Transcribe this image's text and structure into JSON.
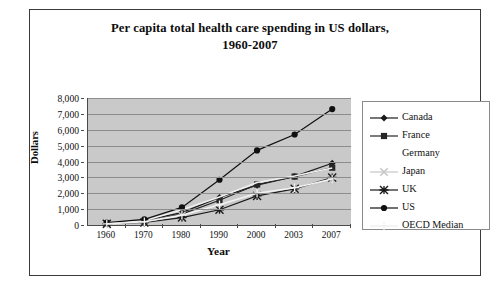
{
  "chart_data": {
    "type": "line",
    "title": "Per capita total health care spending in US dollars,",
    "title_line2": "1960-2007",
    "xlabel": "Year",
    "ylabel": "Dollars",
    "categories": [
      "1960",
      "1970",
      "1980",
      "1990",
      "2000",
      "2003",
      "2007"
    ],
    "ylim": [
      0,
      8000
    ],
    "ytick_labels": [
      "8,000",
      "7,000",
      "6,000",
      "5,000",
      "4,000",
      "3,000",
      "2,000",
      "1,000",
      "0"
    ],
    "ytick_values": [
      8000,
      7000,
      6000,
      5000,
      4000,
      3000,
      2000,
      1000,
      0
    ],
    "grid": true,
    "legend_position": "right",
    "series": [
      {
        "name": "Canada",
        "marker": "diamond",
        "color": "#1a1a1a",
        "values": [
          110,
          290,
          780,
          1740,
          2510,
          3060,
          3890
        ]
      },
      {
        "name": "France",
        "marker": "square",
        "color": "#262626",
        "values": [
          80,
          220,
          690,
          1560,
          2550,
          3050,
          3610
        ]
      },
      {
        "name": "Germany",
        "marker": "none",
        "color": "#efefef",
        "values": [
          100,
          270,
          960,
          1760,
          2680,
          3090,
          3590
        ]
      },
      {
        "name": "Japan",
        "marker": "x",
        "color": "#c6c6c6",
        "values": [
          30,
          150,
          600,
          1120,
          1970,
          2250,
          2760
        ]
      },
      {
        "name": "UK",
        "marker": "asterisk",
        "color": "#1a1a1a",
        "values": [
          80,
          160,
          470,
          960,
          1830,
          2280,
          2990
        ]
      },
      {
        "name": "US",
        "marker": "circle",
        "color": "#101010",
        "values": [
          150,
          360,
          1110,
          2850,
          4700,
          5700,
          7300
        ]
      },
      {
        "name": "OECD Median",
        "marker": "plus",
        "color": "#f2f2f2",
        "values": [
          70,
          200,
          620,
          1280,
          2000,
          2350,
          2900
        ]
      }
    ]
  },
  "legend": {
    "items": [
      {
        "label": "Canada"
      },
      {
        "label": "France"
      },
      {
        "label": "Germany"
      },
      {
        "label": "Japan"
      },
      {
        "label": "UK"
      },
      {
        "label": "US"
      },
      {
        "label": "OECD Median"
      }
    ]
  }
}
